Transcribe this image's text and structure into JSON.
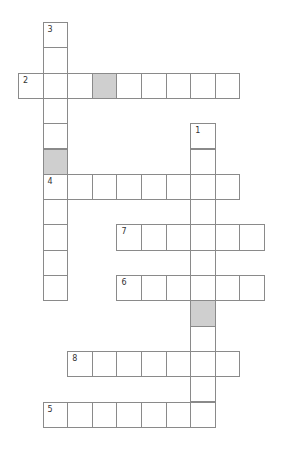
{
  "puzzle": {
    "type": "crossword",
    "origin": {
      "x": 18,
      "y": 22
    },
    "cell_w": 24.6,
    "cell_h": 25.3,
    "colors": {
      "border": "#8a8a8a",
      "shaded": "#cfcfcf",
      "number": "#333333"
    },
    "words": [
      {
        "number": "1",
        "direction": "down",
        "row": 4,
        "col": 7,
        "length": 12,
        "shaded": [
          7
        ]
      },
      {
        "number": "2",
        "direction": "across",
        "row": 2,
        "col": 0,
        "length": 9,
        "shaded": [
          3
        ]
      },
      {
        "number": "3",
        "direction": "down",
        "row": 0,
        "col": 1,
        "length": 11,
        "shaded": [
          5
        ]
      },
      {
        "number": "4",
        "direction": "across",
        "row": 6,
        "col": 1,
        "length": 8,
        "shaded": []
      },
      {
        "number": "5",
        "direction": "across",
        "row": 15,
        "col": 1,
        "length": 7,
        "shaded": []
      },
      {
        "number": "6",
        "direction": "across",
        "row": 10,
        "col": 4,
        "length": 6,
        "shaded": []
      },
      {
        "number": "7",
        "direction": "across",
        "row": 8,
        "col": 4,
        "length": 6,
        "shaded": []
      },
      {
        "number": "8",
        "direction": "across",
        "row": 13,
        "col": 2,
        "length": 7,
        "shaded": []
      }
    ]
  }
}
